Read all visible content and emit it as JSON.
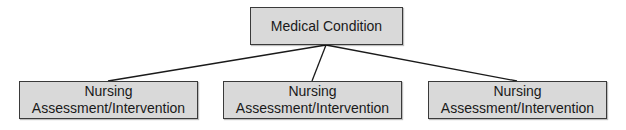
{
  "diagram": {
    "type": "hierarchy-tree",
    "root": {
      "label": "Medical Condition"
    },
    "children": [
      {
        "line1": "Nursing",
        "line2": "Assessment/Intervention"
      },
      {
        "line1": "Nursing",
        "line2": "Assessment/Intervention"
      },
      {
        "line1": "Nursing",
        "line2": "Assessment/Intervention"
      }
    ],
    "colors": {
      "node_fill": "#d9d9d9",
      "node_border": "#3a3a3a",
      "connector": "#1a1a1a",
      "background": "#ffffff"
    }
  }
}
